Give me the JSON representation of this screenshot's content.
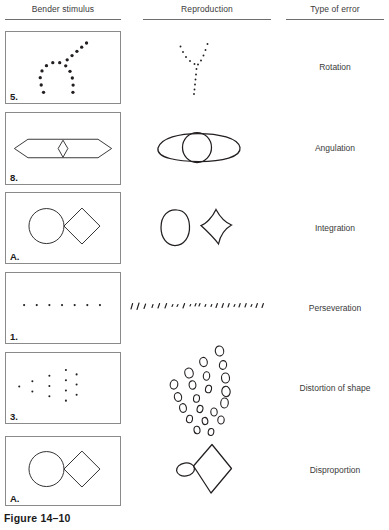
{
  "figure": {
    "caption": "Figure 14–10",
    "columns": [
      {
        "id": "stimulus",
        "label": "Bender stimulus"
      },
      {
        "id": "reproduction",
        "label": "Reproduction"
      },
      {
        "id": "error",
        "label": "Type of error"
      }
    ],
    "ink_color": "#231f20",
    "rule_color": "#6d6d6d",
    "box_border_color": "#8a8a8a",
    "background": "#ffffff",
    "rows": [
      {
        "stimulus_label": "5.",
        "stimulus_figure": "arc-of-dots-with-diagonal-ray",
        "reproduction_figure": "y-shaped-dot-pattern",
        "error": "Rotation"
      },
      {
        "stimulus_label": "8.",
        "stimulus_figure": "elongated-hexagon-with-inner-diamond",
        "reproduction_figure": "ellipse-with-overlapping-circle",
        "error": "Angulation"
      },
      {
        "stimulus_label": "A.",
        "stimulus_figure": "circle-touching-diamond",
        "reproduction_figure": "separated-oval-and-diamond",
        "error": "Integration"
      },
      {
        "stimulus_label": "1.",
        "stimulus_figure": "horizontal-row-of-dots",
        "reproduction_figure": "long-row-of-slanted-dashes",
        "error": "Perseveration"
      },
      {
        "stimulus_label": "3.",
        "stimulus_figure": "arrowhead-of-dot-columns",
        "reproduction_figure": "cluster-of-small-open-loops",
        "error": "Distortion of shape"
      },
      {
        "stimulus_label": "A.",
        "stimulus_figure": "circle-touching-diamond",
        "reproduction_figure": "tiny-oval-with-large-diamond",
        "error": "Disproportion"
      }
    ]
  }
}
